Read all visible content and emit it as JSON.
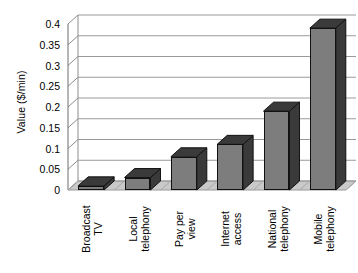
{
  "chart_data": {
    "type": "bar",
    "title": "",
    "xlabel": "",
    "ylabel": "Value ($/min)",
    "categories": [
      "Broadcast\nTV",
      "Local\ntelephony",
      "Pay per\nview",
      "Internet\naccess",
      "National\ntelephony",
      "Mobile\ntelephony"
    ],
    "values": [
      0.01,
      0.03,
      0.08,
      0.11,
      0.19,
      0.39
    ],
    "ylim": [
      0,
      0.4
    ],
    "ytick_step": 0.05,
    "ytick_labels": [
      "0",
      "0.05",
      "0.1",
      "0.15",
      "0.2",
      "0.25",
      "0.3",
      "0.35",
      "0.4"
    ],
    "ytick_values": [
      0,
      0.05,
      0.1,
      0.15,
      0.2,
      0.25,
      0.3,
      0.35,
      0.4
    ],
    "grid": true,
    "legend": false,
    "style": "3d",
    "colors": {
      "bar_front": "#7d7d7d",
      "bar_side": "#3a3a3a",
      "bar_top": "#3a3a3a",
      "floor": "#c9c9c9",
      "gridline": "#9a9a9a",
      "axis": "#6e6e6e",
      "text": "#000000",
      "background": "#ffffff"
    }
  }
}
